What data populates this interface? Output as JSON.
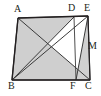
{
  "figure": {
    "type": "geometry-diagram",
    "canvas": {
      "width": 101,
      "height": 96
    },
    "style": {
      "background": "#ffffff",
      "stroke": "#3a3a3a",
      "stroke_dark": "#231f20",
      "shade_fill": "#cfcfcf",
      "shade_fill_light": "#d8d8d8",
      "label_color": "#231f20",
      "stroke_width": 1.1,
      "thin_stroke_width": 0.8
    },
    "points": [
      {
        "id": "A",
        "label": "A",
        "x": 18,
        "y": 18,
        "label_x": 14,
        "label_y": 4
      },
      {
        "id": "D",
        "label": "D",
        "x": 74,
        "y": 17,
        "label_x": 68,
        "label_y": 3
      },
      {
        "id": "E",
        "label": "E",
        "x": 88,
        "y": 16,
        "label_x": 84,
        "label_y": 3
      },
      {
        "id": "M",
        "label": "M",
        "x": 85,
        "y": 47,
        "label_x": 88,
        "label_y": 42
      },
      {
        "id": "B",
        "label": "B",
        "x": 12,
        "y": 80,
        "label_x": 8,
        "label_y": 82
      },
      {
        "id": "F",
        "label": "F",
        "x": 76,
        "y": 80,
        "label_x": 71,
        "label_y": 82
      },
      {
        "id": "C",
        "label": "C",
        "x": 90,
        "y": 80,
        "label_x": 86,
        "label_y": 82
      }
    ],
    "segments": [
      {
        "id": "AB",
        "from": "A",
        "to": "B",
        "kind": "outline"
      },
      {
        "id": "AE",
        "from": "A",
        "to": "E",
        "kind": "outline"
      },
      {
        "id": "BC",
        "from": "B",
        "to": "C",
        "kind": "outline"
      },
      {
        "id": "EC",
        "from": "E",
        "to": "C",
        "kind": "outline"
      },
      {
        "id": "AC",
        "from": "A",
        "to": "C",
        "kind": "cevian"
      },
      {
        "id": "BD",
        "from": "B",
        "to": "D",
        "kind": "cevian"
      },
      {
        "id": "BE",
        "from": "B",
        "to": "E",
        "kind": "cevian"
      },
      {
        "id": "EF",
        "from": "E",
        "to": "F",
        "kind": "cevian"
      },
      {
        "id": "DF",
        "from": "D",
        "to": "F",
        "kind": "cevian"
      }
    ],
    "shaded_regions": [
      {
        "id": "ABC",
        "vertices": [
          "A",
          "B",
          "C"
        ],
        "shade": "primary"
      },
      {
        "id": "ABD",
        "vertices": [
          "A",
          "B",
          "D"
        ],
        "shade": "primary"
      },
      {
        "id": "EFC",
        "vertices": [
          "E",
          "F",
          "C"
        ],
        "shade": "secondary"
      }
    ]
  }
}
